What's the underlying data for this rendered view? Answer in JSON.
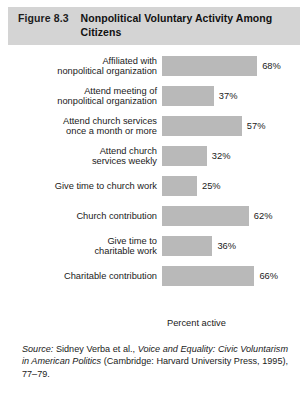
{
  "header": {
    "figure_number": "Figure 8.3",
    "title_line1": "Nonpolitical Voluntary Activity Among",
    "title_line2": "Citizens",
    "band_color": "#d4d4d4"
  },
  "chart_data": {
    "type": "bar",
    "orientation": "horizontal",
    "title": "Nonpolitical Voluntary Activity Among Citizens",
    "xlabel": "Percent active",
    "ylabel": "",
    "xlim": [
      0,
      100
    ],
    "grid": false,
    "legend": "none",
    "bar_color": "#b9b9b9",
    "categories": [
      "Affiliated with\nnonpolitical organization",
      "Attend meeting of\nnonpolitical organization",
      "Attend church services\nonce a month or more",
      "Attend church\nservices weekly",
      "Give time to church work",
      "Church contribution",
      "Give time to\ncharitable work",
      "Charitable contribution"
    ],
    "values": [
      68,
      37,
      57,
      32,
      25,
      62,
      36,
      66
    ],
    "value_labels": [
      "68%",
      "37%",
      "57%",
      "32%",
      "25%",
      "62%",
      "36%",
      "66%"
    ]
  },
  "axis": {
    "x_title": "Percent active"
  },
  "source": {
    "label": "Source:",
    "author_text": " Sidney Verba et al., ",
    "title_italic": "Voice and Equality: Civic Voluntarism in American Politics",
    "publication_text": " (Cambridge: Harvard University Press, 1995), 77–79."
  }
}
